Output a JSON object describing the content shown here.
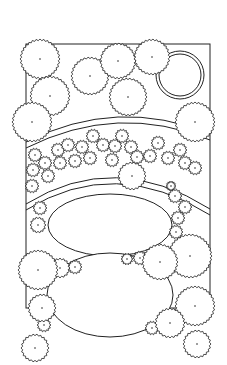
{
  "diagram": {
    "type": "landscape-planting-plan",
    "style": {
      "stroke": "#222222",
      "background": "#ffffff"
    },
    "boundary": {
      "x": 26,
      "y": 44,
      "w": 184,
      "h": 264
    },
    "large_trees": [
      {
        "cx": 40,
        "cy": 59,
        "r": 20
      },
      {
        "cx": 90,
        "cy": 76,
        "r": 19
      },
      {
        "cx": 118,
        "cy": 61,
        "r": 18
      },
      {
        "cx": 152,
        "cy": 57,
        "r": 18
      },
      {
        "cx": 128,
        "cy": 97,
        "r": 19
      },
      {
        "cx": 50,
        "cy": 96,
        "r": 20
      },
      {
        "cx": 32,
        "cy": 122,
        "r": 20
      },
      {
        "cx": 195,
        "cy": 122,
        "r": 20
      },
      {
        "cx": 132,
        "cy": 176,
        "r": 14
      },
      {
        "cx": 38,
        "cy": 270,
        "r": 20
      },
      {
        "cx": 42,
        "cy": 308,
        "r": 14
      },
      {
        "cx": 190,
        "cy": 256,
        "r": 22
      },
      {
        "cx": 195,
        "cy": 306,
        "r": 20
      },
      {
        "cx": 170,
        "cy": 323,
        "r": 15
      },
      {
        "cx": 197,
        "cy": 344,
        "r": 14
      },
      {
        "cx": 160,
        "cy": 262,
        "r": 18
      },
      {
        "cx": 35,
        "cy": 348,
        "r": 14
      }
    ],
    "small_shrubs": [
      {
        "cx": 35,
        "cy": 155,
        "r": 7
      },
      {
        "cx": 45,
        "cy": 163,
        "r": 7
      },
      {
        "cx": 58,
        "cy": 150,
        "r": 7
      },
      {
        "cx": 68,
        "cy": 145,
        "r": 7
      },
      {
        "cx": 60,
        "cy": 163,
        "r": 7
      },
      {
        "cx": 75,
        "cy": 161,
        "r": 7
      },
      {
        "cx": 82,
        "cy": 147,
        "r": 7
      },
      {
        "cx": 93,
        "cy": 136,
        "r": 7
      },
      {
        "cx": 103,
        "cy": 145,
        "r": 7
      },
      {
        "cx": 90,
        "cy": 158,
        "r": 7
      },
      {
        "cx": 115,
        "cy": 146,
        "r": 7
      },
      {
        "cx": 122,
        "cy": 136,
        "r": 7
      },
      {
        "cx": 131,
        "cy": 147,
        "r": 7
      },
      {
        "cx": 137,
        "cy": 157,
        "r": 7
      },
      {
        "cx": 150,
        "cy": 156,
        "r": 7
      },
      {
        "cx": 158,
        "cy": 143,
        "r": 7
      },
      {
        "cx": 168,
        "cy": 158,
        "r": 7
      },
      {
        "cx": 180,
        "cy": 150,
        "r": 7
      },
      {
        "cx": 185,
        "cy": 163,
        "r": 7
      },
      {
        "cx": 195,
        "cy": 168,
        "r": 7
      },
      {
        "cx": 33,
        "cy": 170,
        "r": 7
      },
      {
        "cx": 48,
        "cy": 176,
        "r": 7
      },
      {
        "cx": 32,
        "cy": 186,
        "r": 7
      },
      {
        "cx": 112,
        "cy": 160,
        "r": 7
      },
      {
        "cx": 171,
        "cy": 186,
        "r": 5
      },
      {
        "cx": 175,
        "cy": 196,
        "r": 7
      },
      {
        "cx": 185,
        "cy": 207,
        "r": 7
      },
      {
        "cx": 178,
        "cy": 218,
        "r": 7
      },
      {
        "cx": 176,
        "cy": 232,
        "r": 7
      },
      {
        "cx": 40,
        "cy": 208,
        "r": 7
      },
      {
        "cx": 38,
        "cy": 225,
        "r": 8
      },
      {
        "cx": 127,
        "cy": 259,
        "r": 6
      },
      {
        "cx": 140,
        "cy": 258,
        "r": 7
      },
      {
        "cx": 75,
        "cy": 267,
        "r": 7
      },
      {
        "cx": 60,
        "cy": 268,
        "r": 10
      },
      {
        "cx": 44,
        "cy": 325,
        "r": 7
      },
      {
        "cx": 152,
        "cy": 328,
        "r": 7
      }
    ],
    "circle_feature": {
      "cx": 180,
      "cy": 75,
      "r1": 24,
      "r2": 21
    },
    "arcs": [
      {
        "d": "M26,148 Q118,102 210,140"
      },
      {
        "d": "M26,142 Q118,96 210,134"
      },
      {
        "d": "M26,210 Q115,155 210,215"
      },
      {
        "d": "M26,204 Q115,149 210,209"
      }
    ],
    "ellipses": [
      {
        "cx": 110,
        "cy": 225,
        "rx": 62,
        "ry": 31
      },
      {
        "cx": 110,
        "cy": 295,
        "rx": 63,
        "ry": 42
      }
    ],
    "caption": "Landscape planting plan"
  }
}
